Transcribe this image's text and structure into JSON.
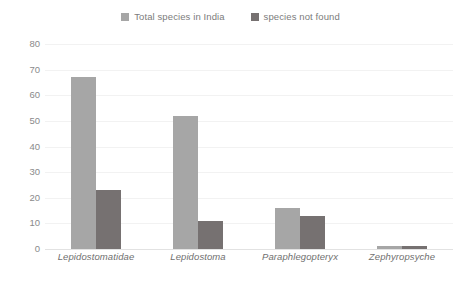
{
  "chart_data": {
    "type": "bar",
    "title": "",
    "subtitle": "",
    "xlabel": "",
    "ylabel": "",
    "categories": [
      "Lepidostomatidae",
      "Lepidostoma",
      "Paraphlegopteryx",
      "Zephyropsyche"
    ],
    "series": [
      {
        "name": "Total species in India",
        "color": "#a6a6a6",
        "values": [
          67,
          52,
          16,
          1
        ]
      },
      {
        "name": "species not found",
        "color": "#767171",
        "values": [
          23,
          11,
          13,
          1
        ]
      }
    ],
    "ylim": [
      0,
      80
    ],
    "yticks": [
      0,
      10,
      20,
      30,
      40,
      50,
      60,
      70,
      80
    ],
    "ytick_labels": [
      "0",
      "10",
      "20",
      "30",
      "40",
      "50",
      "60",
      "70",
      "80"
    ],
    "grid": true,
    "grid_axis": "y",
    "legend_position": "top-center",
    "background_color": "#ffffff",
    "axis_text_color": "#7c7c7c",
    "gridline_color": "#f2f2f2"
  }
}
